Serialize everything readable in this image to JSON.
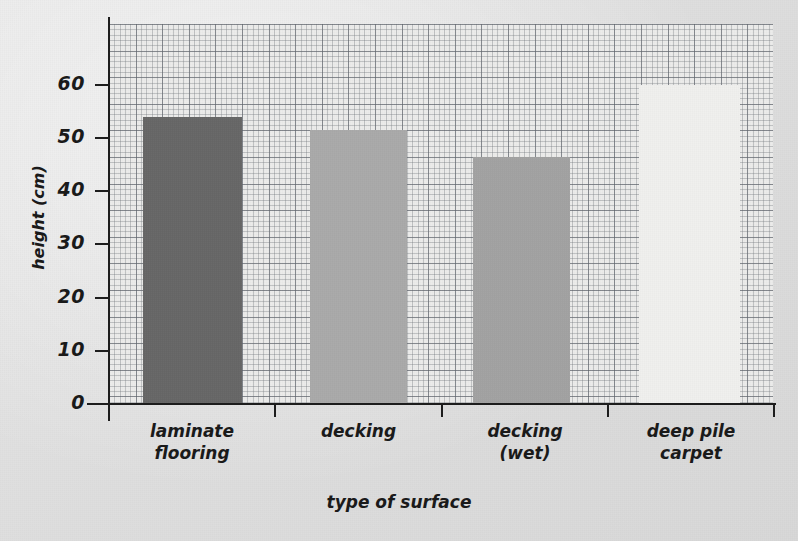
{
  "chart_data": {
    "type": "bar",
    "title": "",
    "xlabel": "type of surface",
    "ylabel": "height (cm)",
    "categories": [
      "laminate flooring",
      "decking",
      "decking (wet)",
      "deep pile carpet"
    ],
    "category_lines": [
      [
        "laminate",
        "flooring"
      ],
      [
        "decking",
        ""
      ],
      [
        "decking",
        "(wet)"
      ],
      [
        "deep pile",
        "carpet"
      ]
    ],
    "values": [
      54,
      51.5,
      46.5,
      60
    ],
    "bar_colors": [
      "#676767",
      "#ababab",
      "#a3a3a3",
      "#f2f2f0"
    ],
    "ylim": [
      0,
      70
    ],
    "ytick_values": [
      0,
      10,
      20,
      30,
      40,
      50,
      60
    ],
    "ytick_labels": [
      "0",
      "10",
      "20",
      "30",
      "40",
      "50",
      "60"
    ],
    "grid": true,
    "grid_style": "graph-paper",
    "minor_grid_unit": 2,
    "major_grid_unit": 10,
    "legend": "none",
    "background_color": "#e2e2e2",
    "plot_background_color": "#ececeb",
    "axis_color": "#1d1d1d"
  }
}
